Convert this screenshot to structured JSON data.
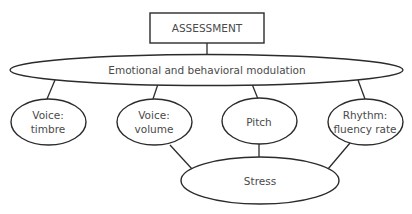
{
  "diagram": {
    "root": {
      "label": "ASSESSMENT"
    },
    "level1": {
      "label": "Emotional and behavioral modulation"
    },
    "level2": [
      {
        "line1": "Voice:",
        "line2": "timbre"
      },
      {
        "line1": "Voice:",
        "line2": "volume"
      },
      {
        "line1": "Pitch",
        "line2": ""
      },
      {
        "line1": "Rhythm:",
        "line2": "fluency rate"
      }
    ],
    "level3": {
      "label": "Stress"
    },
    "edges": [
      [
        "ASSESSMENT",
        "Emotional and behavioral modulation"
      ],
      [
        "Emotional and behavioral modulation",
        "Voice: timbre"
      ],
      [
        "Emotional and behavioral modulation",
        "Voice: volume"
      ],
      [
        "Emotional and behavioral modulation",
        "Pitch"
      ],
      [
        "Emotional and behavioral modulation",
        "Rhythm: fluency rate"
      ],
      [
        "Voice: volume",
        "Stress"
      ],
      [
        "Pitch",
        "Stress"
      ],
      [
        "Rhythm: fluency rate",
        "Stress"
      ]
    ],
    "colors": {
      "stroke": "#2b2b2b",
      "text": "#4a4a4a",
      "background": "#ffffff"
    }
  }
}
